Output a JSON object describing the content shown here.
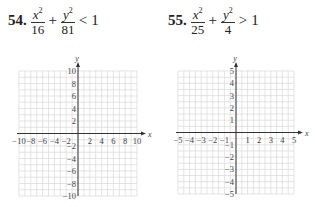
{
  "problems": [
    {
      "number": "54.",
      "term1": {
        "numerator_var": "x",
        "exp": "2",
        "denominator": "16"
      },
      "operator": "+",
      "term2": {
        "numerator_var": "y",
        "exp": "2",
        "denominator": "81"
      },
      "relation": "<",
      "rhs": "1"
    },
    {
      "number": "55.",
      "term1": {
        "numerator_var": "x",
        "exp": "2",
        "denominator": "25"
      },
      "operator": "+",
      "term2": {
        "numerator_var": "y",
        "exp": "2",
        "denominator": "4"
      },
      "relation": ">",
      "rhs": "1"
    }
  ],
  "chart_data": [
    {
      "type": "scatter",
      "title": "Blank coordinate grid for problem 54",
      "xlabel": "x",
      "ylabel": "y",
      "xlim": [
        -10,
        10
      ],
      "ylim": [
        -10,
        10
      ],
      "x_ticks": [
        "-10",
        "-8",
        "-6",
        "-4",
        "-2",
        "2",
        "4",
        "6",
        "8",
        "10"
      ],
      "y_ticks": [
        "10",
        "8",
        "6",
        "4",
        "2",
        "-2",
        "-4",
        "-6",
        "-8",
        "-10"
      ],
      "grid": true,
      "grid_step": 2,
      "series": []
    },
    {
      "type": "scatter",
      "title": "Blank coordinate grid for problem 55",
      "xlabel": "x",
      "ylabel": "y",
      "xlim": [
        -5,
        5
      ],
      "ylim": [
        -5,
        5
      ],
      "x_ticks": [
        "-5",
        "-4",
        "-3",
        "-2",
        "-1",
        "1",
        "2",
        "3",
        "4",
        "5"
      ],
      "y_ticks": [
        "5",
        "4",
        "3",
        "2",
        "1",
        "-1",
        "-2",
        "-3",
        "-4",
        "-5"
      ],
      "grid": true,
      "grid_step": 1,
      "series": []
    }
  ],
  "colors": {
    "grid": "#d8d8d8",
    "axis": "#333333",
    "text": "#222222"
  }
}
